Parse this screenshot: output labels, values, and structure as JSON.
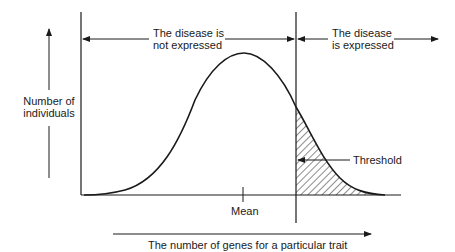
{
  "labels": {
    "not_expressed_1": "The disease is",
    "not_expressed_2": "not expressed",
    "expressed_1": "The disease",
    "expressed_2": "is expressed",
    "y_axis_1": "Number of",
    "y_axis_2": "individuals",
    "threshold": "Threshold",
    "mean": "Mean",
    "x_axis": "The number of genes for a particular trait"
  },
  "colors": {
    "ink": "#1a1a1a",
    "background": "#ffffff"
  }
}
